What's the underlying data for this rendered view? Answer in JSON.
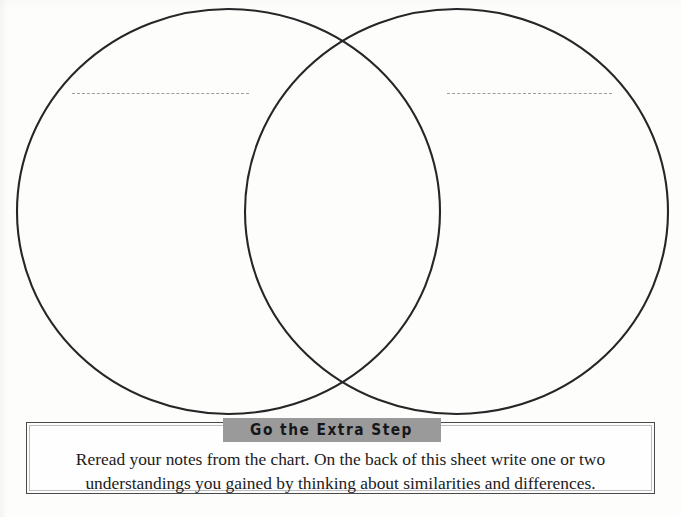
{
  "worksheet": {
    "type": "venn-diagram-worksheet",
    "background_color": "#fdfdfb",
    "ink_color": "#262628"
  },
  "venn": {
    "left_circle": {
      "name": "left-topic-circle",
      "label_line": {
        "name": "left-label-line",
        "style": "dashed",
        "value": "",
        "placeholder": ""
      }
    },
    "right_circle": {
      "name": "right-topic-circle",
      "label_line": {
        "name": "right-label-line",
        "style": "dashed",
        "value": "",
        "placeholder": ""
      }
    },
    "overlap_region": {
      "name": "venn-overlap-region",
      "value": ""
    }
  },
  "instruction_panel": {
    "title": "Go the Extra Step",
    "banner_color": "#9a9a9a",
    "body_line_1": "Reread your notes from the chart. On the back of this sheet write one or two",
    "body_line_2": "understandings you gained by thinking about similarities and differences."
  }
}
